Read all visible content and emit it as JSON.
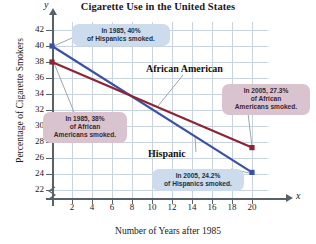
{
  "chart_data": {
    "type": "line",
    "title": "Cigarette Use in the United States",
    "xlabel": "Number of Years after 1985",
    "ylabel": "Percentage of Cigarette Smokers",
    "x_axis_variable": "x",
    "y_axis_variable": "y",
    "xlim": [
      0,
      21
    ],
    "ylim": [
      21,
      43
    ],
    "xticks": [
      2,
      4,
      6,
      8,
      10,
      12,
      14,
      16,
      18,
      20
    ],
    "yticks": [
      22,
      24,
      26,
      28,
      30,
      32,
      34,
      36,
      38,
      40,
      42
    ],
    "grid": true,
    "legend": "inline-labels",
    "y_axis_break": true,
    "series": [
      {
        "name": "Hispanic",
        "color": "#3b52a4",
        "x": [
          0,
          20
        ],
        "values": [
          40,
          24.2
        ],
        "label_text": "Hispanic"
      },
      {
        "name": "African American",
        "color": "#8c2433",
        "x": [
          0,
          20
        ],
        "values": [
          38,
          27.3
        ],
        "label_text": "African American"
      }
    ],
    "annotations": [
      {
        "id": "hispanic-1985",
        "style": "blue",
        "lines": [
          "In 1985, 40%",
          "of Hispanics smoked."
        ],
        "points_to": {
          "x": 0,
          "y": 40
        }
      },
      {
        "id": "african-1985",
        "style": "pink",
        "lines": [
          "In 1985, 38%",
          "of African",
          "Americans smoked."
        ],
        "points_to": {
          "x": 0,
          "y": 38
        }
      },
      {
        "id": "african-2005",
        "style": "pink",
        "lines": [
          "In 2005, 27.3%",
          "of African",
          "Americans smoked."
        ],
        "points_to": {
          "x": 20,
          "y": 27.3
        }
      },
      {
        "id": "hispanic-2005",
        "style": "blue",
        "lines": [
          "In 2005, 24.2%",
          "of Hispanics smoked."
        ],
        "points_to": {
          "x": 20,
          "y": 24.2
        }
      }
    ]
  },
  "labels": {
    "title": "Cigarette Use in the United States",
    "xaxis_title": "Number of Years after 1985",
    "yaxis_title": "Percentage of Cigarette Smokers",
    "x_var": "x",
    "y_var": "y",
    "series_african": "African American",
    "series_hispanic": "Hispanic",
    "callout_hispanic_1985_l1": "In 1985, 40%",
    "callout_hispanic_1985_l2": "of Hispanics smoked.",
    "callout_african_1985_l1": "In 1985, 38%",
    "callout_african_1985_l2": "of African",
    "callout_african_1985_l3": "Americans smoked.",
    "callout_african_2005_l1": "In 2005, 27.3%",
    "callout_african_2005_l2": "of African",
    "callout_african_2005_l3": "Americans smoked.",
    "callout_hispanic_2005_l1": "In 2005, 24.2%",
    "callout_hispanic_2005_l2": "of Hispanics smoked."
  },
  "colors": {
    "hispanic_line": "#3b52a4",
    "african_line": "#8c2433",
    "grid": "#c9d3de",
    "axis": "#58606a",
    "callout_blue": "#ccdced",
    "callout_pink": "#d9c3ce"
  }
}
